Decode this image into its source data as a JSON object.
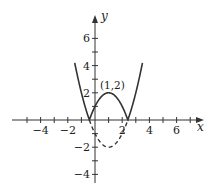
{
  "chart_data": {
    "type": "line",
    "title": "",
    "xlabel": "x",
    "ylabel": "y",
    "xlim": [
      -5.5,
      7.9
    ],
    "ylim": [
      -4.6,
      7.5
    ],
    "grid": false,
    "x_ticks": [
      -5,
      -4,
      -3,
      -2,
      -1,
      1,
      2,
      3,
      4,
      5,
      6,
      7
    ],
    "x_tick_labels": [
      {
        "value": -4,
        "label": "−4"
      },
      {
        "value": -2,
        "label": "−2"
      },
      {
        "value": 2,
        "label": "2"
      },
      {
        "value": 4,
        "label": "4"
      },
      {
        "value": 6,
        "label": "6"
      }
    ],
    "y_ticks": [
      -4,
      -3,
      -2,
      -1,
      1,
      2,
      3,
      4,
      5,
      6
    ],
    "y_tick_labels": [
      {
        "value": 6,
        "label": "6"
      },
      {
        "value": 4,
        "label": "4"
      },
      {
        "value": 2,
        "label": "2"
      },
      {
        "value": -2,
        "label": "−2"
      },
      {
        "value": -4,
        "label": "−4"
      }
    ],
    "series": [
      {
        "name": "y = |x² − 2x − 1|",
        "style": "solid",
        "x_range": [
          -1.49,
          3.49
        ],
        "points": [
          [
            -1.49,
            4.2
          ],
          [
            -1,
            2
          ],
          [
            -0.414,
            0
          ],
          [
            0,
            1
          ],
          [
            1,
            2
          ],
          [
            2,
            1
          ],
          [
            2.414,
            0
          ],
          [
            3,
            2
          ],
          [
            3.49,
            4.2
          ]
        ]
      },
      {
        "name": "y = x² − 2x − 1 (reflected part)",
        "style": "dashed",
        "x_range": [
          -0.414,
          2.414
        ],
        "points": [
          [
            -0.414,
            0
          ],
          [
            0,
            -1
          ],
          [
            1,
            -2
          ],
          [
            2,
            -1
          ],
          [
            2.414,
            0
          ]
        ]
      }
    ],
    "annotations": [
      {
        "text": "(1,2)",
        "x": 1,
        "y": 2
      }
    ],
    "legend": null
  },
  "colors": {
    "curve": "#333333",
    "axis": "#333333"
  }
}
